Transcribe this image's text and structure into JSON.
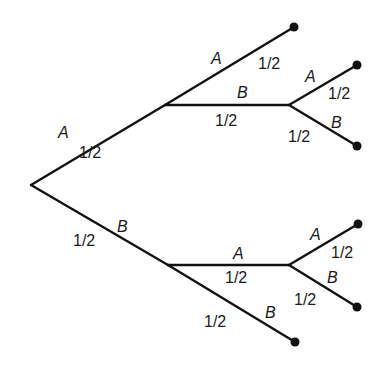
{
  "diagram": {
    "type": "probability-tree",
    "colors": {
      "line": "#111111",
      "text": "#1a1a1a",
      "background": "#ffffff"
    },
    "nodes": {
      "root": {
        "x": 31,
        "y": 185
      },
      "n_A": {
        "x": 165,
        "y": 105
      },
      "n_B": {
        "x": 168,
        "y": 265
      },
      "n_AB": {
        "x": 289,
        "y": 105
      },
      "n_BA": {
        "x": 289,
        "y": 265
      },
      "leaf_AA": {
        "x": 294,
        "y": 27
      },
      "leaf_ABA": {
        "x": 357,
        "y": 65
      },
      "leaf_ABB": {
        "x": 357,
        "y": 146
      },
      "leaf_BAA": {
        "x": 358,
        "y": 224
      },
      "leaf_BAB": {
        "x": 357,
        "y": 307
      },
      "leaf_BB": {
        "x": 295,
        "y": 342
      }
    },
    "edges": [
      {
        "id": "root-A",
        "event": "A",
        "prob": "1/2",
        "ev_pos": [
          58,
          138
        ],
        "prob_pos": [
          79,
          158
        ]
      },
      {
        "id": "root-B",
        "event": "B",
        "prob": "1/2",
        "ev_pos": [
          117,
          232
        ],
        "prob_pos": [
          73,
          246
        ]
      },
      {
        "id": "A-A",
        "event": "A",
        "prob": "1/2",
        "ev_pos": [
          211,
          64
        ],
        "prob_pos": [
          258,
          69
        ]
      },
      {
        "id": "A-B",
        "event": "B",
        "prob": "1/2",
        "ev_pos": [
          237,
          98
        ],
        "prob_pos": [
          215,
          126
        ]
      },
      {
        "id": "AB-A",
        "event": "A",
        "prob": "1/2",
        "ev_pos": [
          305,
          82
        ],
        "prob_pos": [
          328,
          99
        ]
      },
      {
        "id": "AB-B",
        "event": "B",
        "prob": "1/2",
        "ev_pos": [
          331,
          128
        ],
        "prob_pos": [
          288,
          142
        ]
      },
      {
        "id": "B-A",
        "event": "A",
        "prob": "1/2",
        "ev_pos": [
          233,
          259
        ],
        "prob_pos": [
          225,
          283
        ]
      },
      {
        "id": "B-B",
        "event": "B",
        "prob": "1/2",
        "ev_pos": [
          265,
          318
        ],
        "prob_pos": [
          204,
          327
        ]
      },
      {
        "id": "BA-A",
        "event": "A",
        "prob": "1/2",
        "ev_pos": [
          310,
          240
        ],
        "prob_pos": [
          331,
          258
        ]
      },
      {
        "id": "BA-B",
        "event": "B",
        "prob": "1/2",
        "ev_pos": [
          327,
          283
        ],
        "prob_pos": [
          294,
          305
        ]
      }
    ]
  }
}
